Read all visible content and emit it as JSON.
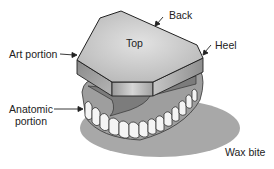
{
  "figure": {
    "labels": {
      "top": "Top",
      "back": "Back",
      "heel": "Heel",
      "art_portion": "Art portion",
      "anatomic_portion_line1": "Anatomic",
      "anatomic_portion_line2": "portion",
      "wax_bite": "Wax bite"
    },
    "colors": {
      "background": "#ffffff",
      "top_face": "#c8c8c8",
      "side_face_light": "#b4b4b4",
      "side_face_dark": "#8c8c8c",
      "shadow": "#a6a6a6",
      "teeth": "#f4f4f4",
      "outline": "#222222",
      "text": "#222222"
    }
  }
}
